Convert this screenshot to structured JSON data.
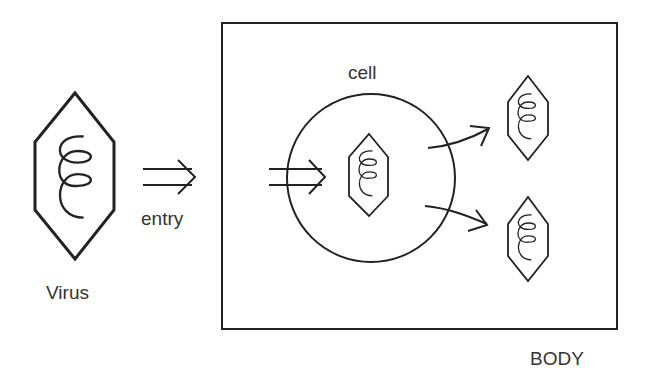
{
  "diagram": {
    "virus_label": "Virus",
    "entry_label": "entry",
    "cell_label": "cell",
    "body_label": "BODY",
    "colors": {
      "stroke": "#222222",
      "text": "#333333",
      "background": "#ffffff"
    }
  }
}
